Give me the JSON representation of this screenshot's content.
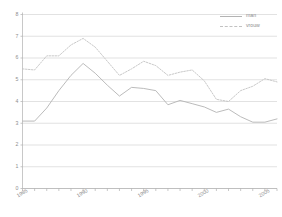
{
  "chart_data": {
    "type": "line",
    "title": "",
    "subtitle": "",
    "xlabel": "",
    "ylabel": "",
    "xlim": [
      1985,
      2006
    ],
    "ylim": [
      0,
      8
    ],
    "grid": true,
    "legend_position": "top-right",
    "y_ticks": [
      "0",
      "1",
      "2",
      "3",
      "4",
      "5",
      "6",
      "7",
      "8"
    ],
    "x_tick_labels": [
      "1985",
      "1990",
      "1995",
      "2000",
      "2005"
    ],
    "x_tick_label_years": [
      1985,
      1990,
      1995,
      2000,
      2005
    ],
    "x_minor_tick_years": [
      1985,
      1986,
      1987,
      1988,
      1989,
      1990,
      1991,
      1992,
      1993,
      1994,
      1995,
      1996,
      1997,
      1998,
      1999,
      2000,
      2001,
      2002,
      2003,
      2004,
      2005,
      2006
    ],
    "x": [
      1985,
      1986,
      1987,
      1988,
      1989,
      1990,
      1991,
      1992,
      1993,
      1994,
      1995,
      1996,
      1997,
      1998,
      1999,
      2000,
      2001,
      2002,
      2003,
      2004,
      2005,
      2006
    ],
    "series": [
      {
        "name": "man",
        "style": "solid",
        "color": "#b3b3b3",
        "values": [
          3.1,
          3.1,
          3.7,
          4.5,
          5.2,
          5.75,
          5.3,
          4.75,
          4.25,
          4.65,
          4.6,
          4.5,
          3.85,
          4.05,
          3.9,
          3.75,
          3.5,
          3.65,
          3.3,
          3.05,
          3.05,
          3.2
        ]
      },
      {
        "name": "vrouw",
        "style": "dashed",
        "color": "#c2c2c2",
        "values": [
          5.5,
          5.45,
          6.1,
          6.1,
          6.6,
          6.9,
          6.5,
          5.85,
          5.2,
          5.5,
          5.85,
          5.65,
          5.2,
          5.35,
          5.45,
          4.95,
          4.1,
          4.0,
          4.5,
          4.7,
          5.05,
          4.9
        ]
      }
    ],
    "legend": [
      {
        "label": "man",
        "style": "solid"
      },
      {
        "label": "vrouw",
        "style": "dashed"
      }
    ],
    "colors": {
      "man_line": "#b3b3b3",
      "vrouw_line": "#c2c2c2",
      "gridline": "#cfcfcf",
      "axis": "#b0b0b0",
      "tick_text": "#8e8e8e",
      "background": "#ffffff"
    }
  }
}
